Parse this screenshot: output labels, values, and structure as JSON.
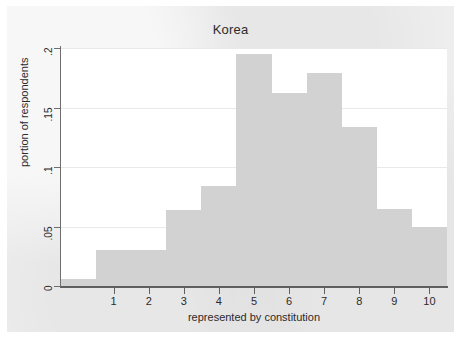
{
  "chart_data": {
    "type": "bar",
    "title": "Korea",
    "xlabel": "represented by constitution",
    "ylabel": "portion of respondents",
    "categories": [
      "0",
      "1",
      "2",
      "3",
      "4",
      "5",
      "6",
      "7",
      "8",
      "9",
      "10"
    ],
    "values": [
      0.006,
      0.03,
      0.03,
      0.064,
      0.084,
      0.195,
      0.162,
      0.179,
      0.134,
      0.065,
      0.05
    ],
    "xtick_labels": [
      "1",
      "2",
      "3",
      "4",
      "5",
      "6",
      "7",
      "8",
      "9",
      "10"
    ],
    "xtick_values": [
      1,
      2,
      3,
      4,
      5,
      6,
      7,
      8,
      9,
      10
    ],
    "ytick_labels": [
      "0",
      ".05",
      ".1",
      ".15",
      ".2"
    ],
    "ytick_values": [
      0,
      0.05,
      0.1,
      0.15,
      0.2
    ],
    "xlim": [
      -0.5,
      10.5
    ],
    "ylim": [
      0,
      0.2
    ],
    "grid": true,
    "legend": false,
    "bar_color": "#d2d2d2",
    "plot_background": "#ffffff",
    "figure_background": "#eeeeee",
    "axis_color": "#5f5f5f",
    "text_color": "#2b2b2b"
  }
}
